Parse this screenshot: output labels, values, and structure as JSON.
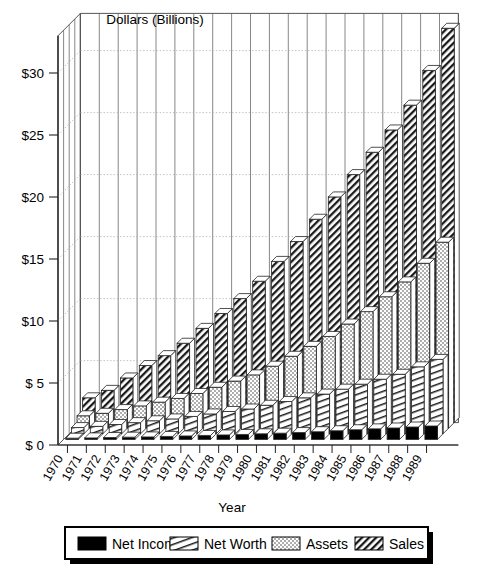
{
  "chart_data": {
    "type": "bar",
    "title": "Dollars (Billions)",
    "subtitle": "",
    "xlabel": "Year",
    "ylabel": "Dollars (Billions)",
    "ylim": [
      0,
      33
    ],
    "yticks": [
      "$ 0",
      "$ 5",
      "$10",
      "$15",
      "$20",
      "$25",
      "$30"
    ],
    "ytick_values": [
      0,
      5,
      10,
      15,
      20,
      25,
      30
    ],
    "grid": true,
    "grid_style": "dotted-horizontal-on-back-wall",
    "projection": "3d-depth-rows",
    "legend_position": "bottom",
    "categories": [
      "1970",
      "1971",
      "1972",
      "1973",
      "1974",
      "1975",
      "1976",
      "1977",
      "1978",
      "1979",
      "1980",
      "1981",
      "1982",
      "1983",
      "1984",
      "1985",
      "1986",
      "1987",
      "1988",
      "1989"
    ],
    "series": [
      {
        "name": "Net Income",
        "fill": "solid-black",
        "color": "#000000",
        "values": [
          0.1,
          0.12,
          0.15,
          0.18,
          0.2,
          0.24,
          0.28,
          0.32,
          0.36,
          0.4,
          0.45,
          0.5,
          0.55,
          0.62,
          0.7,
          0.78,
          0.85,
          0.92,
          1.0,
          1.08
        ]
      },
      {
        "name": "Net Worth",
        "fill": "steep-hatch",
        "color": "#ffffff",
        "values": [
          0.5,
          0.6,
          0.75,
          0.9,
          1.05,
          1.2,
          1.4,
          1.6,
          1.8,
          2.0,
          2.3,
          2.6,
          2.9,
          3.2,
          3.6,
          4.0,
          4.4,
          4.8,
          5.4,
          6.0
        ]
      },
      {
        "name": "Assets",
        "fill": "dotted",
        "color": "#ffffff",
        "values": [
          1.0,
          1.2,
          1.5,
          1.8,
          2.1,
          2.4,
          2.8,
          3.3,
          3.8,
          4.3,
          5.0,
          5.8,
          6.6,
          7.4,
          8.4,
          9.4,
          10.6,
          11.8,
          13.3,
          15.0
        ]
      },
      {
        "name": "Sales",
        "fill": "diagonal-hatch",
        "color": "#ffffff",
        "values": [
          2.0,
          2.6,
          3.6,
          4.6,
          5.4,
          6.4,
          7.6,
          8.8,
          10.0,
          11.4,
          13.0,
          14.6,
          16.4,
          18.2,
          20.0,
          21.8,
          23.6,
          25.6,
          28.4,
          31.8
        ]
      }
    ]
  },
  "legend": {
    "items": [
      {
        "label": "Net Income",
        "swatch": "solid-black"
      },
      {
        "label": "Net Worth",
        "swatch": "steep-hatch"
      },
      {
        "label": "Assets",
        "swatch": "dotted"
      },
      {
        "label": "Sales",
        "swatch": "diagonal-hatch"
      }
    ]
  }
}
